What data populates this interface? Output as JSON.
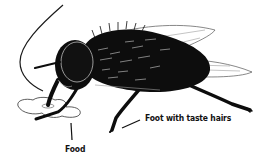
{
  "diagram": {
    "labels": {
      "foot": "Foot with taste hairs",
      "food": "Food"
    },
    "colors": {
      "body": "#0d0d0d",
      "outline": "#1a1a1a",
      "highlight": "#ffffff",
      "background": "#ffffff",
      "food_fill": "#ffffff"
    }
  }
}
